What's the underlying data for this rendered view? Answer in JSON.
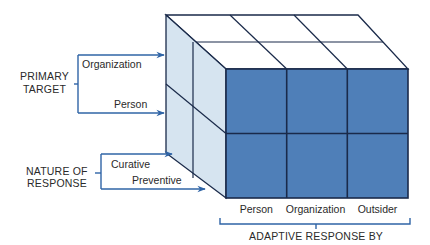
{
  "colors": {
    "front_face": "#4f7fb8",
    "side_face": "#d6e4f0",
    "top_face": "#ffffff",
    "grid_line": "#1a2a4a",
    "arrow": "#2f64a6",
    "text": "#2a2a2a"
  },
  "primary_target": {
    "title_line1": "PRIMARY",
    "title_line2": "TARGET",
    "options": [
      "Organization",
      "Person"
    ]
  },
  "nature_of_response": {
    "title_line1": "NATURE OF",
    "title_line2": "RESPONSE",
    "options": [
      "Curative",
      "Preventive"
    ]
  },
  "adaptive_response_by": {
    "title": "ADAPTIVE RESPONSE BY",
    "options": [
      "Person",
      "Organization",
      "Outsider"
    ]
  }
}
